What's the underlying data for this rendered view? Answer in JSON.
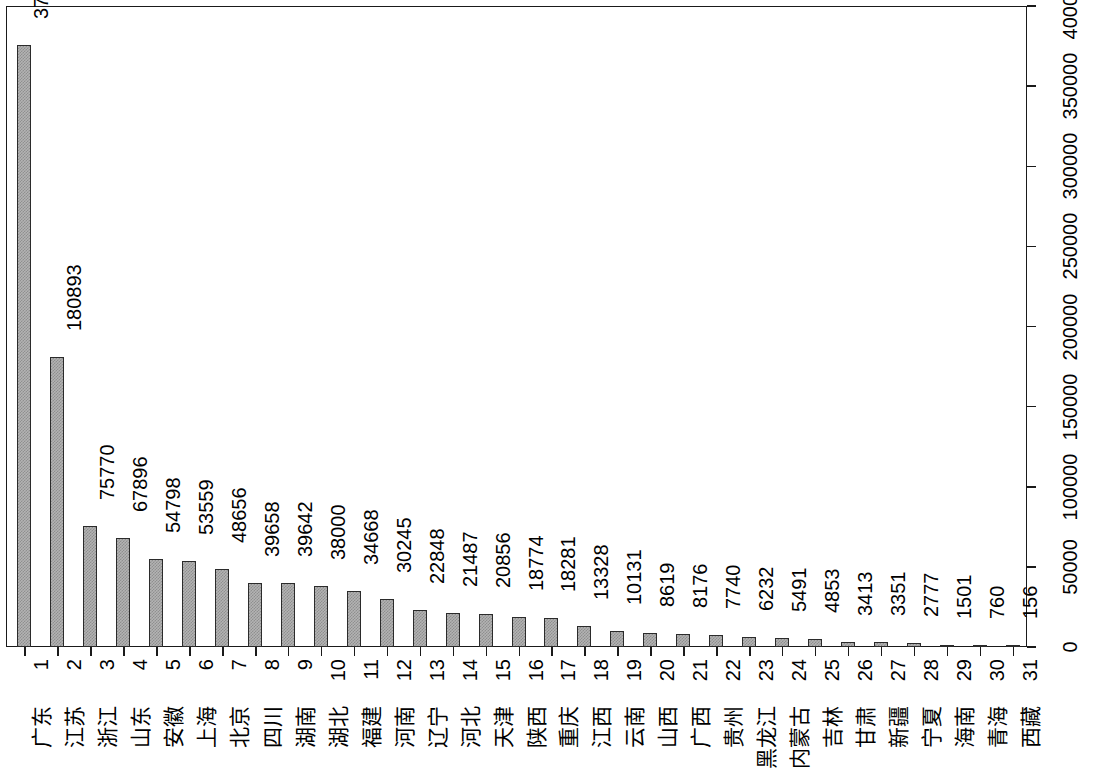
{
  "chart_data": {
    "type": "bar",
    "title": "",
    "subtitle": "",
    "xlabel": "",
    "ylabel": "",
    "orientation": "vertical-rotated-90",
    "grid": false,
    "legend": null,
    "ylim": [
      0,
      400000
    ],
    "y_ticks": [
      "0",
      "50000",
      "100000",
      "150000",
      "200000",
      "250000",
      "300000",
      "350000",
      "400000"
    ],
    "y_tick_values": [
      0,
      50000,
      100000,
      150000,
      200000,
      250000,
      300000,
      350000,
      400000
    ],
    "rank_labels": [
      "1",
      "2",
      "3",
      "4",
      "5",
      "6",
      "7",
      "8",
      "9",
      "10",
      "11",
      "12",
      "13",
      "14",
      "15",
      "16",
      "17",
      "18",
      "19",
      "20",
      "21",
      "22",
      "23",
      "24",
      "25",
      "26",
      "27",
      "28",
      "29",
      "30",
      "31"
    ],
    "categories": [
      "广东",
      "江苏",
      "浙江",
      "山东",
      "安徽",
      "上海",
      "北京",
      "四川",
      "湖南",
      "湖北",
      "福建",
      "河南",
      "辽宁",
      "河北",
      "天津",
      "陕西",
      "重庆",
      "江西",
      "云南",
      "山西",
      "广西",
      "贵州",
      "黑龙江",
      "内蒙古",
      "吉林",
      "甘肃",
      "新疆",
      "宁夏",
      "海南",
      "青海",
      "西藏"
    ],
    "values": [
      375515,
      180893,
      75770,
      67896,
      54798,
      53559,
      48656,
      39658,
      39642,
      38000,
      34668,
      30245,
      22848,
      21487,
      20856,
      18774,
      18281,
      13328,
      10131,
      8619,
      8176,
      7740,
      6232,
      5491,
      4853,
      3413,
      3351,
      2777,
      1501,
      760,
      156
    ],
    "value_labels": [
      "375515",
      "180893",
      "75770",
      "67896",
      "54798",
      "53559",
      "48656",
      "39658",
      "39642",
      "38000",
      "34668",
      "30245",
      "22848",
      "21487",
      "20856",
      "18774",
      "18281",
      "13328",
      "10131",
      "8619",
      "8176",
      "7740",
      "6232",
      "5491",
      "4853",
      "3413",
      "3351",
      "2777",
      "1501",
      "760",
      "156"
    ],
    "colors": {
      "bar_fill": "#b3b3b3",
      "bar_pattern": "#8f8f8f",
      "bar_border": "#2b2b2b",
      "axis": "#1a1a1a",
      "text": "#000000",
      "background": "#ffffff"
    }
  }
}
